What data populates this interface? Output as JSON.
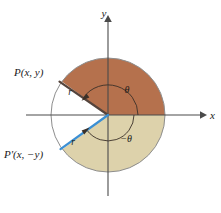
{
  "figure": {
    "canvas": {
      "width": 221,
      "height": 213,
      "background": "#ffffff"
    },
    "circle": {
      "cx": 108,
      "cy": 115,
      "r": 57,
      "outline_color": "#8d8d8d"
    },
    "colors": {
      "sector_upper": "#b5714d",
      "sector_lower": "#ddd2ab",
      "radius_upper": "#55443c",
      "radius_lower": "#3b8fd4",
      "axis": "#4a4a4a",
      "text": "#1a1a1a",
      "arc": "#3a3028",
      "white_wedge": "#ffffff"
    },
    "axes": {
      "x_label": "x",
      "y_label": "y",
      "x_label_pos": {
        "x": 207,
        "y": 119
      },
      "y_label_pos": {
        "x": 104,
        "y": 17
      }
    },
    "points": [
      {
        "name": "point-p",
        "label": "P(x, y)",
        "label_pos": {
          "x": 14,
          "y": 76
        },
        "marker": {
          "x": 58,
          "y": 78
        },
        "angle_deg": 144
      },
      {
        "name": "point-p-prime",
        "label": "P'(x, −y)",
        "label_pos": {
          "x": 6,
          "y": 158
        },
        "marker": {
          "x": 57,
          "y": 151
        },
        "angle_deg": -143
      }
    ],
    "radii": [
      {
        "name": "radius-upper",
        "label": "r",
        "label_pos": {
          "x": 70,
          "y": 94
        },
        "color": "#55443c"
      },
      {
        "name": "radius-lower",
        "label": "r",
        "label_pos": {
          "x": 73,
          "y": 144
        },
        "color": "#3b8fd4"
      }
    ],
    "angles": [
      {
        "name": "angle-theta",
        "label": "θ",
        "label_pos": {
          "x": 127,
          "y": 93
        },
        "direction": "counterclockwise",
        "arc_radius": 30
      },
      {
        "name": "angle-negative-theta",
        "label": "−θ",
        "label_pos": {
          "x": 124,
          "y": 141
        },
        "direction": "clockwise",
        "arc_radius": 26
      }
    ],
    "sectors": [
      {
        "name": "sector-upper",
        "fill": "#b5714d",
        "start_deg": 0,
        "end_deg": 144,
        "description": "terracotta sector from positive x-axis counterclockwise to P"
      },
      {
        "name": "sector-lower",
        "fill": "#ddd2ab",
        "start_deg": 0,
        "end_deg": -143,
        "description": "tan sector from positive x-axis clockwise to P prime"
      }
    ]
  }
}
